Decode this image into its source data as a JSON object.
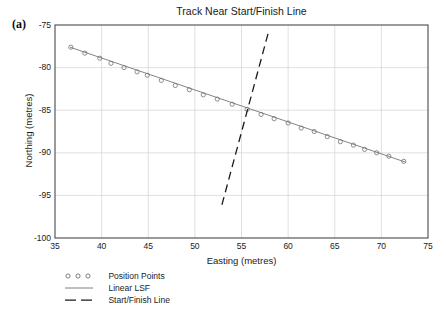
{
  "panel": {
    "label": "(a)"
  },
  "chart_data": {
    "type": "scatter",
    "title": "Track Near Start/Finish Line",
    "xlabel": "Easting (metres)",
    "ylabel": "Northing (metres)",
    "xlim": [
      35,
      75
    ],
    "ylim": [
      -100,
      -75
    ],
    "xticks": [
      35,
      40,
      45,
      50,
      55,
      60,
      65,
      70,
      75
    ],
    "yticks": [
      -75,
      -80,
      -85,
      -90,
      -95,
      -100
    ],
    "xtick_labels": [
      "35",
      "40",
      "45",
      "50",
      "55",
      "60",
      "65",
      "70",
      "75"
    ],
    "ytick_labels": [
      "-75",
      "-80",
      "-85",
      "-90",
      "-95",
      "-100"
    ],
    "grid": true,
    "legend_position": "below-left",
    "series": [
      {
        "name": "Position Points",
        "type": "scatter",
        "marker": "open-circle",
        "color": "#7a7a7a",
        "x": [
          36.7,
          38.2,
          39.8,
          41.0,
          42.4,
          43.8,
          44.9,
          46.4,
          47.9,
          49.4,
          50.9,
          52.4,
          54.0,
          55.6,
          57.1,
          58.5,
          60.0,
          61.4,
          62.8,
          64.2,
          65.6,
          67.0,
          68.2,
          69.5,
          70.8,
          72.4
        ],
        "y": [
          -77.6,
          -78.3,
          -78.9,
          -79.5,
          -80.0,
          -80.5,
          -80.9,
          -81.5,
          -82.1,
          -82.6,
          -83.2,
          -83.7,
          -84.3,
          -84.9,
          -85.5,
          -86.0,
          -86.5,
          -87.1,
          -87.5,
          -88.1,
          -88.7,
          -89.1,
          -89.6,
          -90.0,
          -90.4,
          -91.0
        ]
      },
      {
        "name": "Linear LSF",
        "type": "line",
        "style": "solid",
        "color": "#6e6e6e",
        "x": [
          36.6,
          72.6
        ],
        "y": [
          -77.6,
          -91.1
        ]
      },
      {
        "name": "Start/Finish Line",
        "type": "line",
        "style": "dashed",
        "color": "#1a1a1a",
        "x": [
          52.9,
          57.9
        ],
        "y": [
          -96.1,
          -75.8
        ]
      }
    ]
  },
  "legend": {
    "items": [
      {
        "label": "Position Points",
        "key": "open-circle-marker"
      },
      {
        "label": "Linear LSF",
        "key": "solid-line"
      },
      {
        "label": "Start/Finish Line",
        "key": "dashed-line"
      }
    ]
  }
}
